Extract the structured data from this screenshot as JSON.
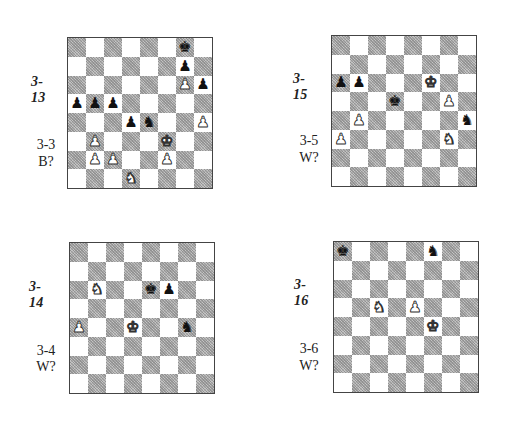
{
  "diagrams": [
    {
      "id": "3-13",
      "title": "3-13",
      "ref": "3-3",
      "to_move": "B?",
      "position": {
        "g8": "bK",
        "g7": "bP",
        "g6": "wP",
        "h6": "bP",
        "a5": "bP",
        "b5": "bP",
        "c5": "bP",
        "d4": "bP",
        "e4": "bN",
        "h4": "wP",
        "b3": "wP",
        "f3": "wK",
        "b2": "wP",
        "c2": "wP",
        "f2": "wP",
        "d1": "wN"
      }
    },
    {
      "id": "3-15",
      "title": "3-15",
      "ref": "3-5",
      "to_move": "W?",
      "position": {
        "a6": "bP",
        "b6": "bP",
        "f6": "wK",
        "d5": "bK",
        "g5": "wP",
        "b4": "wP",
        "h4": "bN",
        "a3": "wP",
        "g3": "wN"
      }
    },
    {
      "id": "3-14",
      "title": "3-14",
      "ref": "3-4",
      "to_move": "W?",
      "position": {
        "b6": "wN",
        "e6": "bK",
        "f6": "bP",
        "a4": "wP",
        "d4": "wK",
        "g4": "bN"
      }
    },
    {
      "id": "3-16",
      "title": "3-16",
      "ref": "3-6",
      "to_move": "W?",
      "position": {
        "a8": "bK",
        "f8": "bN",
        "c5": "wN",
        "e5": "wP",
        "f4": "wK"
      }
    }
  ],
  "piece_glyphs": {
    "K": "♚",
    "Q": "♛",
    "R": "♜",
    "B": "♝",
    "N": "♞",
    "P": "♟"
  },
  "colors": {
    "light_square": "#ffffff",
    "dark_square": "#c4c4c4",
    "border": "#444444"
  }
}
